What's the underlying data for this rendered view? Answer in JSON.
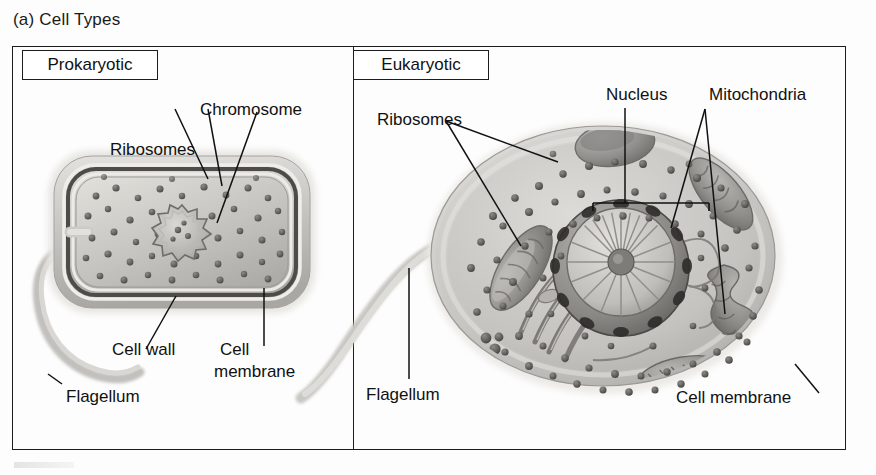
{
  "figure": {
    "title": "(a) Cell Types",
    "panels": [
      {
        "tag": "Prokaryotic"
      },
      {
        "tag": "Eukaryotic"
      }
    ]
  },
  "prokaryotic_labels": {
    "chromosome": "Chromosome",
    "ribosomes": "Ribosomes",
    "cell_wall": "Cell wall",
    "cell_membrane_line1": "Cell",
    "cell_membrane_line2": "membrane",
    "flagellum": "Flagellum"
  },
  "eukaryotic_labels": {
    "ribosomes": "Ribosomes",
    "nucleus": "Nucleus",
    "mitochondria": "Mitochondria",
    "flagellum": "Flagellum",
    "cell_membrane": "Cell membrane"
  },
  "colors": {
    "ink": "#111111",
    "frame": "#1c1c1c",
    "page": "#ffffff",
    "cell_light": "#d7d5d2",
    "cell_mid": "#b2b0ad",
    "cell_dark": "#7d7b78",
    "membrane_dark": "#4a4846",
    "cytoplasm": "#cfcdc9",
    "ribosome_dot": "#5f5d5a",
    "nucleus_shell": "#8c8a86"
  }
}
